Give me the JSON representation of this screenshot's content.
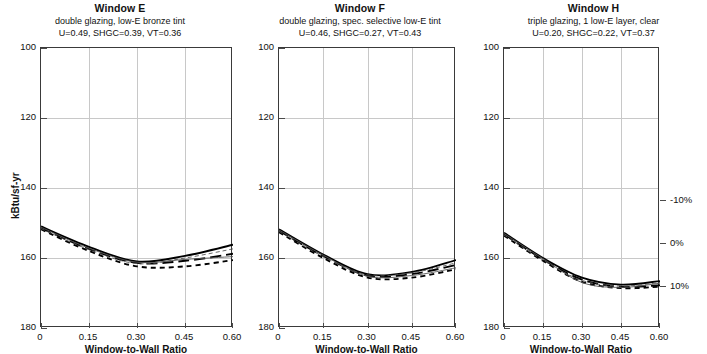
{
  "figure": {
    "y_axis_title": "kBtu/sf-yr",
    "x_axis_title": "Window-to-Wall Ratio",
    "y_ticks": [
      "180",
      "160",
      "140",
      "120",
      "100"
    ],
    "x_ticks": [
      "0",
      "0.15",
      "0.30",
      "0.45",
      "0.60"
    ],
    "right_axis_ticks": [
      "10%",
      "0%",
      "-10%"
    ]
  },
  "panels": [
    {
      "id": "window-e",
      "title": "Window E",
      "subtitle1": "double glazing, low-E bronze tint",
      "subtitle2": "U=0.49, SHGC=0.39, VT=0.36"
    },
    {
      "id": "window-f",
      "title": "Window F",
      "subtitle1": "double glazing, spec. selective low-E tint",
      "subtitle2": "U=0.46, SHGC=0.27, VT=0.43"
    },
    {
      "id": "window-h",
      "title": "Window H",
      "subtitle1": "triple glazing, 1 low-E layer, clear",
      "subtitle2": "U=0.20, SHGC=0.22, VT=0.37"
    }
  ],
  "chart_data": {
    "type": "line",
    "xlabel": "Window-to-Wall Ratio",
    "ylabel": "kBtu/sf-yr",
    "xlim": [
      0,
      0.6
    ],
    "ylim": [
      100,
      180
    ],
    "xticks": [
      0,
      0.15,
      0.3,
      0.45,
      0.6
    ],
    "yticks": [
      100,
      120,
      140,
      160,
      180
    ],
    "grid": true,
    "legend": "none",
    "secondary_yaxis": {
      "label": "percent difference",
      "ticks": [
        -10,
        0,
        10
      ],
      "ticklabels": [
        "-10%",
        "0%",
        "10%"
      ],
      "position": "right-of-panel-3"
    },
    "x": [
      0,
      0.15,
      0.3,
      0.45,
      0.6
    ],
    "panels": [
      {
        "name": "Window E",
        "annotation": "double glazing, low-E bronze tint; U=0.49, SHGC=0.39, VT=0.36",
        "series": [
          {
            "name": "solid",
            "style": "solid",
            "values": [
              129.0,
              123.2,
              119.0,
              120.6,
              123.8
            ]
          },
          {
            "name": "long-dash",
            "style": "long-dash",
            "values": [
              128.6,
              122.6,
              118.6,
              119.2,
              121.2
            ]
          },
          {
            "name": "short-dash",
            "style": "short-dash",
            "values": [
              128.2,
              122.0,
              117.6,
              117.6,
              119.4
            ]
          },
          {
            "name": "thin-line",
            "style": "thin-solid",
            "values": [
              128.8,
              122.8,
              118.8,
              119.6,
              120.4
            ]
          },
          {
            "name": "thin-dash",
            "style": "thin-dash",
            "values": [
              128.4,
              122.4,
              118.4,
              120.0,
              122.6
            ]
          }
        ]
      },
      {
        "name": "Window F",
        "annotation": "double glazing, spec. selective low-E tint; U=0.46, SHGC=0.27, VT=0.43",
        "series": [
          {
            "name": "solid",
            "style": "solid",
            "values": [
              128.2,
              121.0,
              115.4,
              116.0,
              119.4
            ]
          },
          {
            "name": "long-dash",
            "style": "long-dash",
            "values": [
              127.8,
              120.6,
              115.0,
              115.4,
              118.0
            ]
          },
          {
            "name": "short-dash",
            "style": "short-dash",
            "values": [
              127.4,
              120.0,
              114.4,
              114.4,
              116.8
            ]
          },
          {
            "name": "thin-line",
            "style": "thin-solid",
            "values": [
              128.0,
              120.8,
              114.8,
              115.0,
              117.2
            ]
          },
          {
            "name": "thin-dash",
            "style": "thin-dash",
            "values": [
              127.6,
              120.4,
              115.2,
              115.8,
              118.6
            ]
          }
        ]
      },
      {
        "name": "Window H",
        "annotation": "triple glazing, 1 low-E layer, clear; U=0.20, SHGC=0.22, VT=0.37",
        "series": [
          {
            "name": "solid",
            "style": "solid",
            "values": [
              127.2,
              120.0,
              114.4,
              112.4,
              113.4
            ]
          },
          {
            "name": "long-dash",
            "style": "long-dash",
            "values": [
              126.8,
              119.6,
              113.8,
              111.8,
              112.2
            ]
          },
          {
            "name": "short-dash",
            "style": "short-dash",
            "values": [
              126.4,
              119.2,
              113.2,
              111.4,
              111.8
            ]
          },
          {
            "name": "thin-line",
            "style": "thin-solid",
            "values": [
              127.0,
              119.8,
              113.0,
              111.6,
              112.8
            ]
          },
          {
            "name": "thin-dash",
            "style": "thin-dash",
            "values": [
              126.6,
              119.4,
              113.6,
              112.0,
              113.0
            ]
          }
        ]
      }
    ]
  }
}
